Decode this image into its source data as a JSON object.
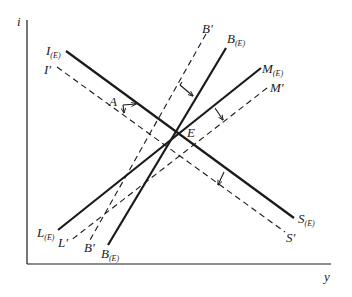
{
  "diagram": {
    "type": "IS-LM-BP shift diagram",
    "axes": {
      "y_label": "i",
      "x_label": "y"
    },
    "equilibrium_label": "E",
    "point_label": "A",
    "curves": [
      {
        "id": "I_E",
        "label_start": "I",
        "label_start_sub": "(E)",
        "label_end": "S",
        "label_end_sub": "(E)",
        "style": "solid"
      },
      {
        "id": "I_prime",
        "label_start": "I′",
        "label_end": "S′",
        "style": "dashed"
      },
      {
        "id": "B_E",
        "label_top": "B",
        "label_top_sub": "(E)",
        "label_bottom": "B",
        "label_bottom_sub": "(E)",
        "style": "solid"
      },
      {
        "id": "B_prime",
        "label_top": "B′",
        "label_bottom": "B′",
        "style": "dashed"
      },
      {
        "id": "M_E",
        "label_top": "M",
        "label_top_sub": "(E)",
        "label_bottom": "L",
        "label_bottom_sub": "(E)",
        "style": "solid"
      },
      {
        "id": "M_prime",
        "label_top": "M′",
        "label_bottom": "L′",
        "style": "dashed"
      }
    ],
    "colors": {
      "ink": "#1a1a1a",
      "background": "#ffffff"
    }
  }
}
